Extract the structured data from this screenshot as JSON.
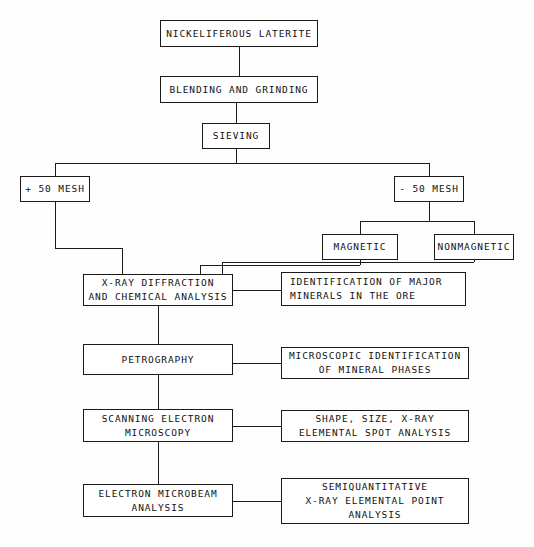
{
  "diagram": {
    "type": "flowchart",
    "line_color": "#1a1a1a",
    "background_color": "#fefefe",
    "text_color": "#111111",
    "nodes": [
      {
        "id": "feed",
        "label": "NICKELIFEROUS LATERITE",
        "x": 160,
        "y": 20,
        "w": 158,
        "h": 27
      },
      {
        "id": "blending",
        "label": "BLENDING AND GRINDING",
        "x": 160,
        "y": 76,
        "w": 158,
        "h": 27
      },
      {
        "id": "sieving",
        "label": "SIEVING",
        "x": 202,
        "y": 123,
        "w": 68,
        "h": 26
      },
      {
        "id": "plus50",
        "label": "+ 50 MESH",
        "x": 20,
        "y": 176,
        "w": 70,
        "h": 26
      },
      {
        "id": "minus50",
        "label": "- 50 MESH",
        "x": 394,
        "y": 176,
        "w": 70,
        "h": 26
      },
      {
        "id": "magnetic",
        "label": "MAGNETIC",
        "x": 322,
        "y": 234,
        "w": 76,
        "h": 26
      },
      {
        "id": "nonmagnetic",
        "label": "NONMAGNETIC",
        "x": 434,
        "y": 234,
        "w": 80,
        "h": 26
      },
      {
        "id": "xrd",
        "label": "X-RAY DIFFRACTION\nAND CHEMICAL ANALYSIS",
        "x": 83,
        "y": 274,
        "w": 150,
        "h": 32
      },
      {
        "id": "identification",
        "label": "IDENTIFICATION OF MAJOR\nMINERALS IN THE ORE",
        "x": 281,
        "y": 272,
        "w": 185,
        "h": 34,
        "align": "left"
      },
      {
        "id": "petrography",
        "label": "PETROGRAPHY",
        "x": 83,
        "y": 344,
        "w": 150,
        "h": 31
      },
      {
        "id": "microscopic",
        "label": "MICROSCOPIC IDENTIFICATION\nOF MINERAL PHASES",
        "x": 281,
        "y": 347,
        "w": 188,
        "h": 32
      },
      {
        "id": "sem",
        "label": "SCANNING ELECTRON\nMICROSCOPY",
        "x": 83,
        "y": 409,
        "w": 150,
        "h": 33
      },
      {
        "id": "shape",
        "label": "SHAPE, SIZE, X-RAY\nELEMENTAL SPOT ANALYSIS",
        "x": 281,
        "y": 410,
        "w": 188,
        "h": 32
      },
      {
        "id": "microbeam",
        "label": "ELECTRON MICROBEAM\nANALYSIS",
        "x": 83,
        "y": 484,
        "w": 150,
        "h": 33
      },
      {
        "id": "semiquant",
        "label": "SEMIQUANTITATIVE\nX-RAY ELEMENTAL POINT\nANALYSIS",
        "x": 281,
        "y": 478,
        "w": 188,
        "h": 46
      }
    ],
    "connectors": [
      {
        "from": "feed",
        "to": "blending",
        "orient": "v",
        "x": 239,
        "y": 47,
        "len": 29
      },
      {
        "from": "blending",
        "to": "sieving",
        "orient": "v",
        "x": 236,
        "y": 103,
        "len": 20
      },
      {
        "from": "sieving",
        "to": "split-bus",
        "orient": "v",
        "x": 236,
        "y": 149,
        "len": 14
      },
      {
        "from": "split-bus",
        "to": "mesh-branches",
        "orient": "h",
        "x": 55,
        "y": 163,
        "len": 374
      },
      {
        "from": "split-bus",
        "to": "plus50",
        "orient": "v",
        "x": 55,
        "y": 163,
        "len": 13
      },
      {
        "from": "split-bus",
        "to": "minus50",
        "orient": "v",
        "x": 429,
        "y": 163,
        "len": 13
      },
      {
        "from": "plus50",
        "to": "drop-a",
        "orient": "v",
        "x": 55,
        "y": 202,
        "len": 46
      },
      {
        "from": "drop-a",
        "to": "run-right",
        "orient": "h",
        "x": 55,
        "y": 248,
        "len": 68
      },
      {
        "from": "run-right",
        "to": "xrd",
        "orient": "v",
        "x": 122,
        "y": 248,
        "len": 26
      },
      {
        "from": "minus50",
        "to": "mag-bus",
        "orient": "v",
        "x": 429,
        "y": 202,
        "len": 19
      },
      {
        "from": "mag-bus",
        "to": "mag-branches",
        "orient": "h",
        "x": 360,
        "y": 221,
        "len": 114
      },
      {
        "from": "mag-bus",
        "to": "magnetic",
        "orient": "v",
        "x": 360,
        "y": 221,
        "len": 13
      },
      {
        "from": "mag-bus",
        "to": "nonmagnetic",
        "orient": "v",
        "x": 474,
        "y": 221,
        "len": 13
      },
      {
        "from": "magnetic",
        "to": "mag-drop",
        "orient": "v",
        "x": 360,
        "y": 260,
        "len": 5
      },
      {
        "from": "mag-drop",
        "to": "mag-left",
        "orient": "h",
        "x": 200,
        "y": 265,
        "len": 160
      },
      {
        "from": "mag-left",
        "to": "xrd",
        "orient": "v",
        "x": 200,
        "y": 265,
        "len": 9
      },
      {
        "from": "nonmagnetic",
        "to": "non-drop",
        "orient": "v",
        "x": 474,
        "y": 260,
        "len": 2
      },
      {
        "from": "non-drop",
        "to": "non-left",
        "orient": "h",
        "x": 222,
        "y": 262,
        "len": 252
      },
      {
        "from": "non-left",
        "to": "xrd",
        "orient": "v",
        "x": 222,
        "y": 262,
        "len": 12
      },
      {
        "from": "xrd",
        "to": "identification",
        "orient": "h",
        "x": 233,
        "y": 290,
        "len": 48
      },
      {
        "from": "xrd",
        "to": "petrography",
        "orient": "v",
        "x": 158,
        "y": 306,
        "len": 38
      },
      {
        "from": "petrography",
        "to": "microscopic",
        "orient": "h",
        "x": 233,
        "y": 363,
        "len": 48
      },
      {
        "from": "petrography",
        "to": "sem",
        "orient": "v",
        "x": 158,
        "y": 375,
        "len": 34
      },
      {
        "from": "sem",
        "to": "shape",
        "orient": "h",
        "x": 233,
        "y": 426,
        "len": 48
      },
      {
        "from": "sem",
        "to": "microbeam",
        "orient": "v",
        "x": 158,
        "y": 442,
        "len": 42
      },
      {
        "from": "microbeam",
        "to": "semiquant",
        "orient": "h",
        "x": 233,
        "y": 501,
        "len": 48
      }
    ]
  }
}
